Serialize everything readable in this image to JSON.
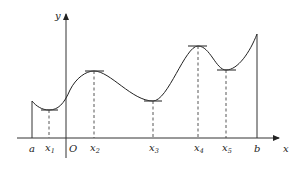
{
  "diagram": {
    "type": "function-graph-extrema",
    "axes": {
      "x_label": "x",
      "y_label": "y",
      "origin_label": "O"
    },
    "points": [
      {
        "id": "a",
        "label": "a",
        "sub": "",
        "kind": "endpoint"
      },
      {
        "id": "x1",
        "label": "x",
        "sub": "1",
        "kind": "local-min"
      },
      {
        "id": "x2",
        "label": "x",
        "sub": "2",
        "kind": "local-max"
      },
      {
        "id": "x3",
        "label": "x",
        "sub": "3",
        "kind": "local-min"
      },
      {
        "id": "x4",
        "label": "x",
        "sub": "4",
        "kind": "local-max"
      },
      {
        "id": "x5",
        "label": "x",
        "sub": "5",
        "kind": "local-min"
      },
      {
        "id": "b",
        "label": "b",
        "sub": "",
        "kind": "endpoint"
      }
    ]
  }
}
